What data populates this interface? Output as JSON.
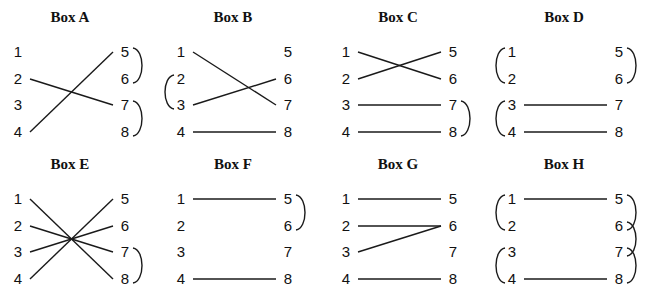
{
  "diagram": {
    "boxes": [
      {
        "id": "A",
        "title": "Box A",
        "origin": [
          0,
          0
        ],
        "wires": [
          [
            4,
            5
          ],
          [
            2,
            7
          ]
        ],
        "loops": [
          {
            "side": "right",
            "from": 5,
            "to": 6
          },
          {
            "side": "right",
            "from": 7,
            "to": 8
          }
        ]
      },
      {
        "id": "B",
        "title": "Box B",
        "origin": [
          163,
          0
        ],
        "wires": [
          [
            1,
            7
          ],
          [
            3,
            6
          ],
          [
            4,
            8
          ]
        ],
        "loops": [
          {
            "side": "left",
            "from": 2,
            "to": 3
          }
        ]
      },
      {
        "id": "C",
        "title": "Box C",
        "origin": [
          328,
          0
        ],
        "wires": [
          [
            1,
            6
          ],
          [
            2,
            5
          ],
          [
            3,
            7
          ],
          [
            4,
            8
          ]
        ],
        "loops": [
          {
            "side": "right",
            "from": 7,
            "to": 8
          }
        ]
      },
      {
        "id": "D",
        "title": "Box D",
        "origin": [
          494,
          0
        ],
        "wires": [
          [
            3,
            7
          ],
          [
            4,
            8
          ]
        ],
        "loops": [
          {
            "side": "left",
            "from": 1,
            "to": 2
          },
          {
            "side": "right",
            "from": 5,
            "to": 6
          },
          {
            "side": "left",
            "from": 3,
            "to": 4
          }
        ]
      },
      {
        "id": "E",
        "title": "Box E",
        "origin": [
          0,
          147
        ],
        "wires": [
          [
            1,
            8
          ],
          [
            2,
            7
          ],
          [
            3,
            6
          ],
          [
            4,
            5
          ]
        ],
        "loops": [
          {
            "side": "right",
            "from": 7,
            "to": 8
          }
        ]
      },
      {
        "id": "F",
        "title": "Box F",
        "origin": [
          163,
          147
        ],
        "wires": [
          [
            1,
            5
          ],
          [
            4,
            8
          ]
        ],
        "loops": [
          {
            "side": "right",
            "from": 5,
            "to": 6
          }
        ]
      },
      {
        "id": "G",
        "title": "Box G",
        "origin": [
          328,
          147
        ],
        "wires": [
          [
            1,
            5
          ],
          [
            2,
            6
          ],
          [
            3,
            6
          ],
          [
            4,
            8
          ]
        ],
        "loops": []
      },
      {
        "id": "H",
        "title": "Box H",
        "origin": [
          494,
          147
        ],
        "wires": [
          [
            1,
            5
          ],
          [
            4,
            8
          ]
        ],
        "loops": [
          {
            "side": "left",
            "from": 1,
            "to": 2
          },
          {
            "side": "left",
            "from": 3,
            "to": 4
          },
          {
            "side": "right",
            "from": 5,
            "to": 6
          },
          {
            "side": "right",
            "from": 6,
            "to": 7
          },
          {
            "side": "right",
            "from": 7,
            "to": 8
          }
        ]
      }
    ],
    "left_terminals": [
      "1",
      "2",
      "3",
      "4"
    ],
    "right_terminals": [
      "5",
      "6",
      "7",
      "8"
    ]
  }
}
